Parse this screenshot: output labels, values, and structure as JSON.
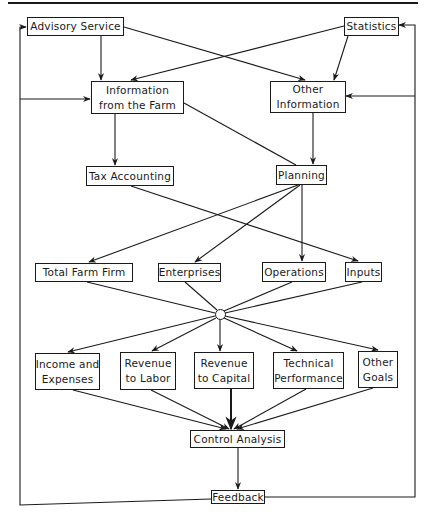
{
  "diagram": {
    "type": "flowchart",
    "nodes": {
      "advisory_service": {
        "lines": [
          "Advisory Service"
        ]
      },
      "statistics": {
        "lines": [
          "Statistics"
        ]
      },
      "info_farm": {
        "lines": [
          "Information",
          "from the Farm"
        ]
      },
      "other_info": {
        "lines": [
          "Other",
          "Information"
        ]
      },
      "tax_accounting": {
        "lines": [
          "Tax Accounting"
        ]
      },
      "planning": {
        "lines": [
          "Planning"
        ]
      },
      "total_farm_firm": {
        "lines": [
          "Total Farm Firm"
        ]
      },
      "enterprises": {
        "lines": [
          "Enterprises"
        ]
      },
      "operations": {
        "lines": [
          "Operations"
        ]
      },
      "inputs": {
        "lines": [
          "Inputs"
        ]
      },
      "income_expenses": {
        "lines": [
          "Income and",
          "Expenses"
        ]
      },
      "revenue_labor": {
        "lines": [
          "Revenue",
          "to Labor"
        ]
      },
      "revenue_capital": {
        "lines": [
          "Revenue",
          "to Capital"
        ]
      },
      "technical_performance": {
        "lines": [
          "Technical",
          "Performance"
        ]
      },
      "other_goals": {
        "lines": [
          "Other",
          "Goals"
        ]
      },
      "control_analysis": {
        "lines": [
          "Control Analysis"
        ]
      },
      "feedback": {
        "lines": [
          "Feedback"
        ]
      }
    },
    "edges": [
      {
        "from": "Advisory Service",
        "to": "Information from the Farm"
      },
      {
        "from": "Advisory Service",
        "to": "Other Information"
      },
      {
        "from": "Statistics",
        "to": "Information from the Farm"
      },
      {
        "from": "Statistics",
        "to": "Other Information"
      },
      {
        "from": "Information from the Farm",
        "to": "Tax Accounting"
      },
      {
        "from": "Information from the Farm",
        "to": "Planning"
      },
      {
        "from": "Other Information",
        "to": "Planning"
      },
      {
        "from": "Tax Accounting",
        "to": "Inputs"
      },
      {
        "from": "Planning",
        "to": "Total Farm Firm"
      },
      {
        "from": "Planning",
        "to": "Enterprises"
      },
      {
        "from": "Planning",
        "to": "Operations"
      },
      {
        "from": "Total Farm Firm",
        "to": "hub"
      },
      {
        "from": "Enterprises",
        "to": "hub"
      },
      {
        "from": "Operations",
        "to": "hub"
      },
      {
        "from": "Inputs",
        "to": "hub"
      },
      {
        "from": "hub",
        "to": "Income and Expenses"
      },
      {
        "from": "hub",
        "to": "Revenue to Labor"
      },
      {
        "from": "hub",
        "to": "Revenue to Capital"
      },
      {
        "from": "hub",
        "to": "Technical Performance"
      },
      {
        "from": "hub",
        "to": "Other Goals"
      },
      {
        "from": "Income and Expenses",
        "to": "Control Analysis"
      },
      {
        "from": "Revenue to Labor",
        "to": "Control Analysis"
      },
      {
        "from": "Revenue to Capital",
        "to": "Control Analysis"
      },
      {
        "from": "Technical Performance",
        "to": "Control Analysis"
      },
      {
        "from": "Other Goals",
        "to": "Control Analysis"
      },
      {
        "from": "Control Analysis",
        "to": "Feedback"
      },
      {
        "from": "Feedback",
        "to": "Advisory Service",
        "via": "left loop"
      },
      {
        "from": "Feedback",
        "to": "Information from the Farm",
        "via": "left loop"
      },
      {
        "from": "Feedback",
        "to": "Statistics",
        "via": "right loop"
      },
      {
        "from": "Feedback",
        "to": "Other Information",
        "via": "right loop"
      }
    ],
    "colors": {
      "line": "#1a1a1a",
      "background": "#ffffff"
    }
  }
}
